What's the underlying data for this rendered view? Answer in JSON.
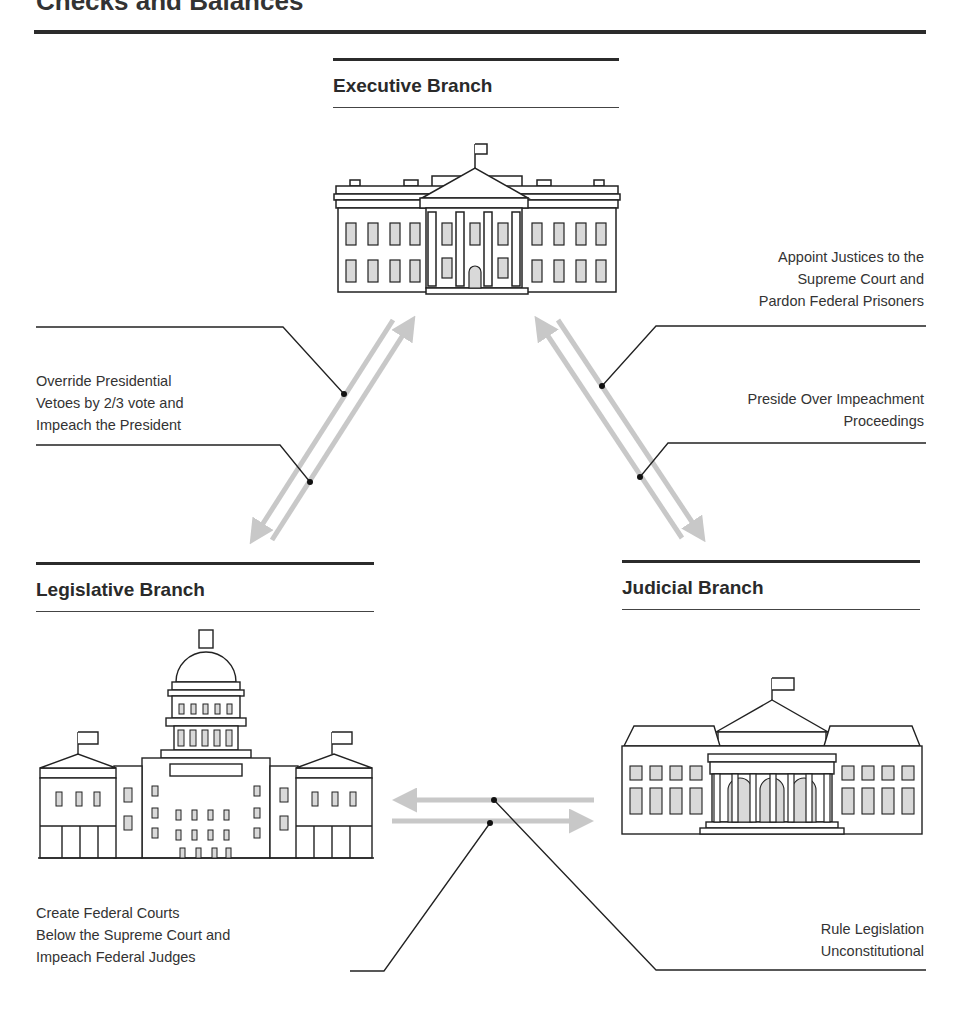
{
  "title": "Checks and Balances",
  "branches": {
    "executive": {
      "name": "Executive Branch",
      "icon": "white-house-icon"
    },
    "legislative": {
      "name": "Legislative Branch",
      "icon": "capitol-building-icon"
    },
    "judicial": {
      "name": "Judicial Branch",
      "icon": "supreme-court-building-icon"
    }
  },
  "checks": {
    "legislative_on_executive": [
      "Override Presidential",
      "Vetoes by 2/3 vote and",
      "Impeach the President"
    ],
    "executive_on_judicial": [
      "Appoint Justices to the",
      "Supreme Court and",
      "Pardon Federal Prisoners"
    ],
    "judicial_on_executive": [
      "Preside Over Impeachment",
      "Proceedings"
    ],
    "legislative_on_judicial": [
      "Create Federal Courts",
      "Below the Supreme Court and",
      "Impeach Federal Judges"
    ],
    "judicial_on_legislative": [
      "Rule Legislation",
      "Unconstitutional"
    ]
  },
  "colors": {
    "arrow": "#c8c8c8",
    "line": "#222222",
    "window_fill": "#d9d9d9"
  }
}
